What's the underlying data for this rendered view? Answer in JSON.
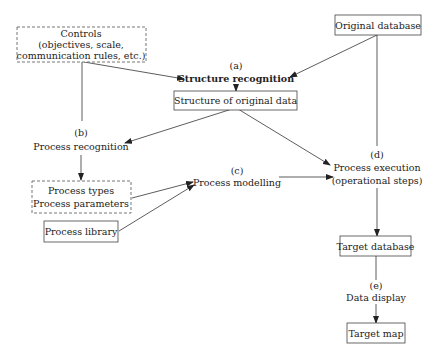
{
  "diagram": {
    "nodes": {
      "controls": {
        "lines": [
          "Controls",
          "(objectives, scale,",
          "communication rules, etc.)"
        ],
        "style": "dashed"
      },
      "original_db": {
        "lines": [
          "Original database"
        ],
        "style": "solid"
      },
      "structure_recognition": {
        "label": "(a)",
        "lines": [
          "Structure recognition"
        ],
        "style": "text-bold"
      },
      "structure_data": {
        "lines": [
          "Structure of original data"
        ],
        "style": "solid"
      },
      "process_recognition": {
        "label": "(b)",
        "lines": [
          "Process recognition"
        ],
        "style": "text"
      },
      "process_types": {
        "lines": [
          "Process types",
          "Process parameters"
        ],
        "style": "dashed"
      },
      "process_library": {
        "lines": [
          "Process library"
        ],
        "style": "solid"
      },
      "process_modelling": {
        "label": "(c)",
        "lines": [
          "Process modelling"
        ],
        "style": "text"
      },
      "process_execution": {
        "label": "(d)",
        "lines": [
          "Process execution",
          "(operational steps)"
        ],
        "style": "text"
      },
      "target_db": {
        "lines": [
          "Target database"
        ],
        "style": "solid"
      },
      "data_display": {
        "label": "(e)",
        "lines": [
          "Data display"
        ],
        "style": "text"
      },
      "target_map": {
        "lines": [
          "Target map"
        ],
        "style": "solid"
      }
    },
    "edges": [
      {
        "from": "controls",
        "to": "structure_recognition"
      },
      {
        "from": "original_db",
        "to": "structure_recognition"
      },
      {
        "from": "structure_recognition",
        "to": "structure_data"
      },
      {
        "from": "controls",
        "to": "process_recognition"
      },
      {
        "from": "structure_data",
        "to": "process_recognition"
      },
      {
        "from": "structure_data",
        "to": "process_execution"
      },
      {
        "from": "process_recognition",
        "to": "process_types"
      },
      {
        "from": "process_types",
        "to": "process_modelling"
      },
      {
        "from": "process_library",
        "to": "process_modelling"
      },
      {
        "from": "process_modelling",
        "to": "process_execution"
      },
      {
        "from": "original_db",
        "to": "process_execution"
      },
      {
        "from": "process_execution",
        "to": "target_db"
      },
      {
        "from": "target_db",
        "to": "data_display"
      },
      {
        "from": "data_display",
        "to": "target_map"
      }
    ]
  }
}
